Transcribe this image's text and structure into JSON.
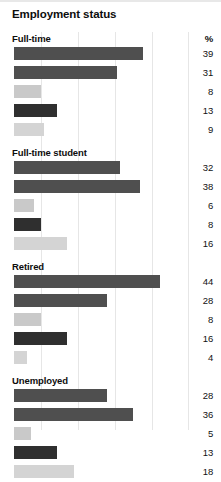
{
  "chart": {
    "title": "Employment status",
    "percent_header": "%",
    "type": "bar"
  },
  "chart_data": {
    "type": "bar",
    "title": "Employment status",
    "orientation": "horizontal",
    "xlabel": "",
    "ylabel": "",
    "unit_label": "%",
    "xlim": [
      0,
      44
    ],
    "grid": true,
    "grid_positions_px": [
      41,
      78,
      115,
      152,
      188
    ],
    "max_value": 44,
    "series_colors": [
      "#4f4f4f",
      "#4f4f4f",
      "#c9c9c9",
      "#2f2f2f",
      "#d4d4d4"
    ],
    "groups": [
      {
        "label": "Full-time",
        "values": [
          39,
          31,
          8,
          13,
          9
        ]
      },
      {
        "label": "Full-time student",
        "values": [
          32,
          38,
          6,
          8,
          16
        ]
      },
      {
        "label": "Retired",
        "values": [
          44,
          28,
          8,
          16,
          4
        ]
      },
      {
        "label": "Unemployed",
        "values": [
          28,
          36,
          5,
          13,
          18
        ]
      }
    ]
  }
}
